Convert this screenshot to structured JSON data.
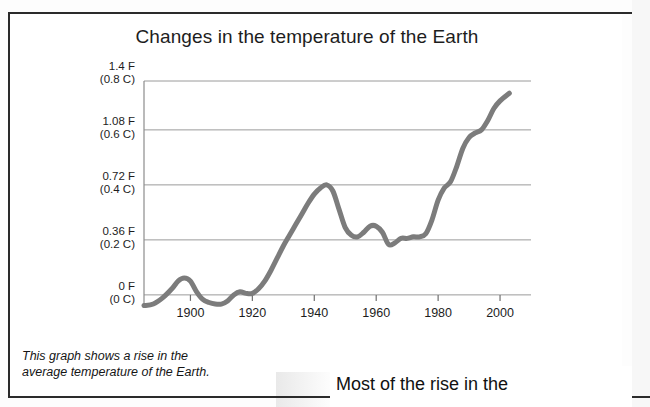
{
  "page": {
    "caption_line1": "This graph shows a rise in the",
    "caption_line2": "average temperature of the Earth.",
    "bottom_text": "Most of the rise in the"
  },
  "chart_data": {
    "type": "line",
    "title": "Changes in the temperature of the Earth",
    "xlabel": "",
    "ylabel": "",
    "xlim": [
      1885,
      2010
    ],
    "ylim": [
      -0.09,
      1.4
    ],
    "grid": true,
    "legend": "none",
    "line_color": "#7c7c7c",
    "grid_color": "#9a9a9a",
    "axis_color": "#8c8c8c",
    "y_ticks": [
      {
        "value": 1.4,
        "label_f": "1.4  F",
        "label_c": "(0.8  C)"
      },
      {
        "value": 1.08,
        "label_f": "1.08  F",
        "label_c": "(0.6  C)"
      },
      {
        "value": 0.72,
        "label_f": "0.72  F",
        "label_c": "(0.4  C)"
      },
      {
        "value": 0.36,
        "label_f": "0.36  F",
        "label_c": "(0.2  C)"
      },
      {
        "value": 0.0,
        "label_f": "0  F",
        "label_c": "(0  C)"
      }
    ],
    "x_ticks": [
      {
        "value": 1900,
        "label": "1900"
      },
      {
        "value": 1920,
        "label": "1920"
      },
      {
        "value": 1940,
        "label": "1940"
      },
      {
        "value": 1960,
        "label": "1960"
      },
      {
        "value": 1980,
        "label": "1980"
      },
      {
        "value": 2000,
        "label": "2000"
      }
    ],
    "series": [
      {
        "name": "Global average temperature change",
        "units_primary": "F",
        "units_secondary": "C",
        "x": [
          1885,
          1888,
          1891,
          1894,
          1896,
          1898,
          1900,
          1902,
          1904,
          1906,
          1908,
          1910,
          1912,
          1914,
          1916,
          1918,
          1920,
          1922,
          1924,
          1926,
          1928,
          1930,
          1932,
          1934,
          1936,
          1938,
          1940,
          1942,
          1944,
          1946,
          1948,
          1950,
          1952,
          1954,
          1956,
          1958,
          1960,
          1962,
          1964,
          1966,
          1968,
          1970,
          1972,
          1974,
          1976,
          1978,
          1980,
          1982,
          1984,
          1986,
          1988,
          1990,
          1992,
          1994,
          1996,
          1998,
          2000,
          2003
        ],
        "y": [
          -0.07,
          -0.06,
          -0.02,
          0.04,
          0.09,
          0.11,
          0.09,
          0.02,
          -0.03,
          -0.05,
          -0.06,
          -0.06,
          -0.04,
          0.0,
          0.02,
          0.01,
          0.01,
          0.04,
          0.09,
          0.16,
          0.24,
          0.32,
          0.39,
          0.46,
          0.53,
          0.6,
          0.66,
          0.7,
          0.72,
          0.68,
          0.56,
          0.44,
          0.39,
          0.38,
          0.41,
          0.45,
          0.45,
          0.41,
          0.33,
          0.34,
          0.37,
          0.37,
          0.38,
          0.38,
          0.4,
          0.49,
          0.62,
          0.7,
          0.74,
          0.84,
          0.96,
          1.03,
          1.06,
          1.08,
          1.14,
          1.22,
          1.27,
          1.32
        ]
      }
    ]
  }
}
